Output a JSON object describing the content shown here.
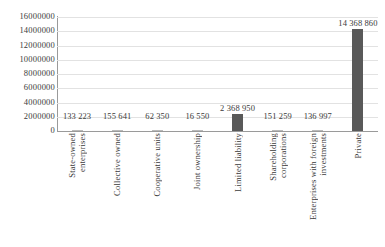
{
  "chart_data": {
    "type": "bar",
    "title": "",
    "xlabel": "",
    "ylabel": "",
    "ylim": [
      0,
      16000000
    ],
    "ytick_step": 2000000,
    "grid": true,
    "legend": false,
    "bar_color": "#595959",
    "categories": [
      "State-owned enterprises",
      "Collective owned",
      "Cooperative units",
      "Joint ownership",
      "Limited liability",
      "Shareholding corporations",
      "Enterprises with foreign investments",
      "Private"
    ],
    "category_lines": [
      [
        "State-owned",
        "enterprises"
      ],
      [
        "Collective owned"
      ],
      [
        "Cooperative units"
      ],
      [
        "Joint ownership"
      ],
      [
        "Limited liability"
      ],
      [
        "Shareholding",
        "corporations"
      ],
      [
        "Enterprises with foreign",
        "investments"
      ],
      [
        "Private"
      ]
    ],
    "values": [
      133223,
      155641,
      62350,
      16550,
      2368950,
      151259,
      136997,
      14368860
    ],
    "data_labels": [
      "133 223",
      "155 641",
      "62 350",
      "16 550",
      "2 368 950",
      "151 259",
      "136 997",
      "14 368 860"
    ],
    "ytick_labels": [
      "16000000",
      "14000000",
      "12000000",
      "10000000",
      "8000000",
      "6000000",
      "4000000",
      "2000000",
      "0"
    ],
    "ytick_values": [
      16000000,
      14000000,
      12000000,
      10000000,
      8000000,
      6000000,
      4000000,
      2000000,
      0
    ]
  }
}
